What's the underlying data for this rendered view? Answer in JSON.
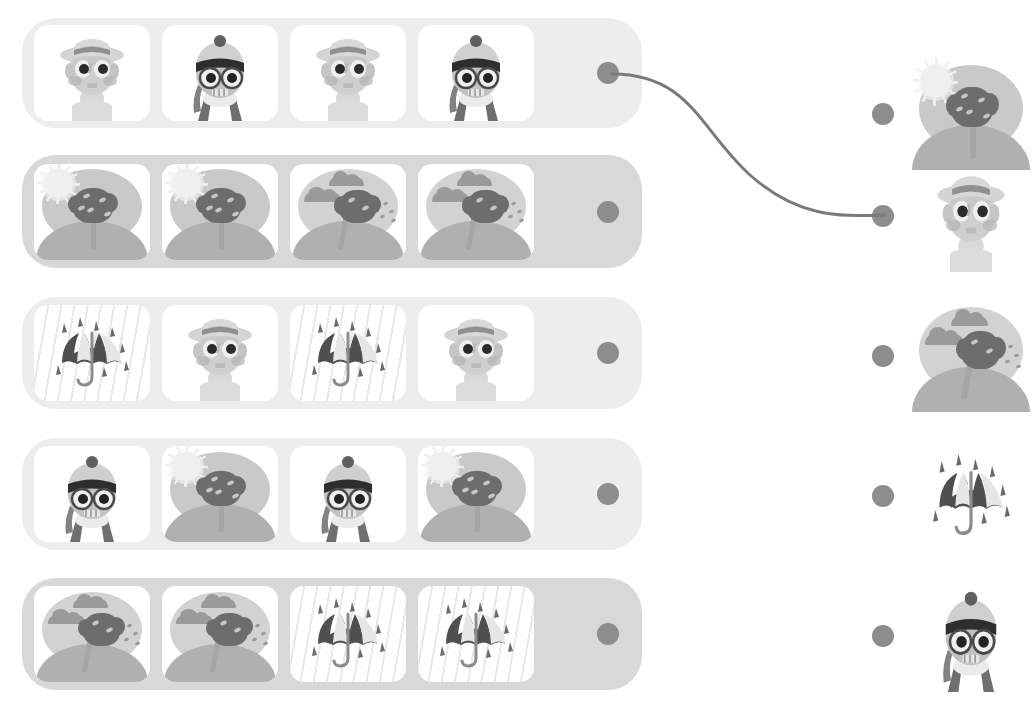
{
  "worksheet": {
    "title": "Pattern Matching Worksheet",
    "type": "pattern-completion",
    "instruction_text": "",
    "rows_count": 5,
    "cards_per_row": 4,
    "answers_count": 5
  },
  "palette": {
    "page_background": "#ffffff",
    "row_background_light": "#ededed",
    "row_background_mid": "#d8d8d8",
    "card_background": "#ffffff",
    "dot": "#8d8d8d",
    "connector_line": "#7a7a7a",
    "art_dark": "#6d6d6d",
    "art_mid": "#9a9a9a",
    "art_light": "#c9c9c9",
    "sun": "#efefef",
    "ground": "#b0b0b0"
  },
  "rows": [
    {
      "id": "row-1",
      "label": "Row 1",
      "background": "#ededed",
      "dot_label": "Row 1 connector dot",
      "cards": [
        {
          "icon": "man-with-hat-icon",
          "label": "Man with sun hat"
        },
        {
          "icon": "boy-with-beanie-icon",
          "label": "Boy with beanie and scarf"
        },
        {
          "icon": "man-with-hat-icon",
          "label": "Man with sun hat"
        },
        {
          "icon": "boy-with-beanie-icon",
          "label": "Boy with beanie and scarf"
        }
      ]
    },
    {
      "id": "row-2",
      "label": "Row 2",
      "background": "#d8d8d8",
      "dot_label": "Row 2 connector dot",
      "cards": [
        {
          "icon": "sunny-tree-icon",
          "label": "Sunny tree"
        },
        {
          "icon": "sunny-tree-icon",
          "label": "Sunny tree"
        },
        {
          "icon": "windy-tree-icon",
          "label": "Windy cloudy tree"
        },
        {
          "icon": "windy-tree-icon",
          "label": "Windy cloudy tree"
        }
      ]
    },
    {
      "id": "row-3",
      "label": "Row 3",
      "background": "#ededed",
      "dot_label": "Row 3 connector dot",
      "cards": [
        {
          "icon": "rain-umbrella-icon",
          "label": "Umbrella in the rain"
        },
        {
          "icon": "man-with-hat-icon",
          "label": "Man with sun hat"
        },
        {
          "icon": "rain-umbrella-icon",
          "label": "Umbrella in the rain"
        },
        {
          "icon": "man-with-hat-icon",
          "label": "Man with sun hat"
        }
      ]
    },
    {
      "id": "row-4",
      "label": "Row 4",
      "background": "#ededed",
      "dot_label": "Row 4 connector dot",
      "cards": [
        {
          "icon": "boy-with-beanie-icon",
          "label": "Boy with beanie and scarf"
        },
        {
          "icon": "sunny-tree-icon",
          "label": "Sunny tree"
        },
        {
          "icon": "boy-with-beanie-icon",
          "label": "Boy with beanie and scarf"
        },
        {
          "icon": "sunny-tree-icon",
          "label": "Sunny tree"
        }
      ]
    },
    {
      "id": "row-5",
      "label": "Row 5",
      "background": "#d8d8d8",
      "dot_label": "Row 5 connector dot",
      "cards": [
        {
          "icon": "windy-tree-icon",
          "label": "Windy cloudy tree"
        },
        {
          "icon": "windy-tree-icon",
          "label": "Windy cloudy tree"
        },
        {
          "icon": "rain-umbrella-icon",
          "label": "Umbrella in the rain"
        },
        {
          "icon": "rain-umbrella-icon",
          "label": "Umbrella in the rain"
        }
      ]
    }
  ],
  "answers": [
    {
      "id": "answer-1",
      "icon": "sunny-tree-icon",
      "label": "Sunny tree",
      "dot_label": "Answer 1 connector dot"
    },
    {
      "id": "answer-2",
      "icon": "man-with-hat-icon",
      "label": "Man with sun hat",
      "dot_label": "Answer 2 connector dot"
    },
    {
      "id": "answer-3",
      "icon": "windy-tree-icon",
      "label": "Windy cloudy tree",
      "dot_label": "Answer 3 connector dot"
    },
    {
      "id": "answer-4",
      "icon": "rain-umbrella-icon",
      "label": "Umbrella in the rain",
      "dot_label": "Answer 4 connector dot"
    },
    {
      "id": "answer-5",
      "icon": "boy-with-beanie-icon",
      "label": "Boy with beanie and scarf",
      "dot_label": "Answer 5 connector dot"
    }
  ],
  "connections": [
    {
      "from": "row-1",
      "to": "answer-2",
      "color": "#7a7a7a",
      "width": 3
    }
  ]
}
